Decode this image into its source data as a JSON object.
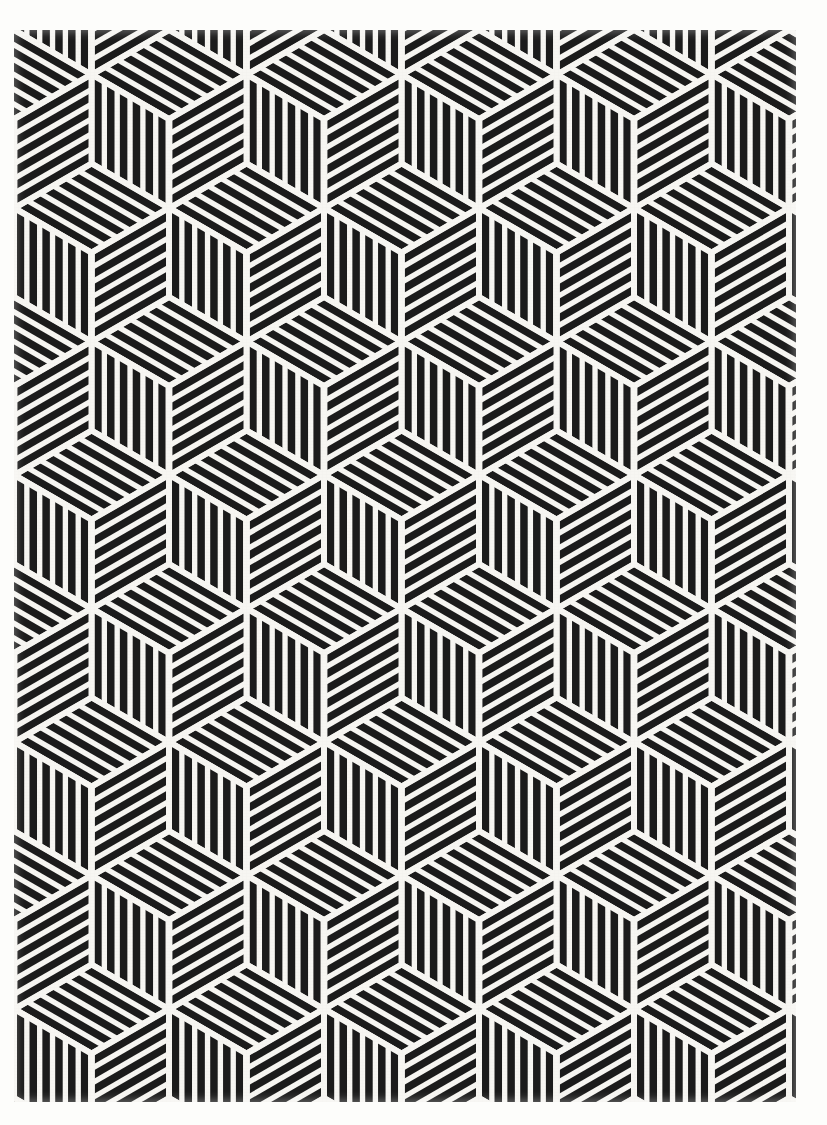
{
  "artwork": {
    "title": "Hexagonal Cube Tessellation",
    "medium": "black ink line pattern on off-white paper",
    "canvas": {
      "width": 827,
      "height": 1125
    },
    "background_color": "#fdfdfb",
    "paper_color": "#f7f6f2",
    "ink_color": "#1b1b1b"
  },
  "plate": {
    "left": 14,
    "top": 30,
    "width": 782,
    "height": 1072
  },
  "pattern": {
    "type": "hexagonal-rhombille",
    "description": "Regular hexagons each subdivided into three rhombi forming an isometric cube; every rhombus is filled with parallel hatch lines running parallel to one of its own edges.",
    "hex_radius": 89,
    "column_spacing": 155,
    "row_spacing": 133.5,
    "row_offset_x": 77.5,
    "stroke_width": 7.5,
    "hatch_gap": 15.5,
    "hatch_lines_per_rhombus": 6,
    "rhombi_per_hexagon": 3,
    "gutter_width": 6,
    "orientation_degrees": [
      90,
      210,
      330
    ],
    "ink_color": "#1b1b1b",
    "gutter_color": "#f7f6f2"
  },
  "chart_data": {
    "type": "heatmap",
    "xlabel": "",
    "ylabel": "",
    "categories": [
      "rhombus-top",
      "rhombus-left",
      "rhombus-right"
    ],
    "values": [
      6,
      6,
      6
    ],
    "grid": false,
    "legend": "none"
  }
}
